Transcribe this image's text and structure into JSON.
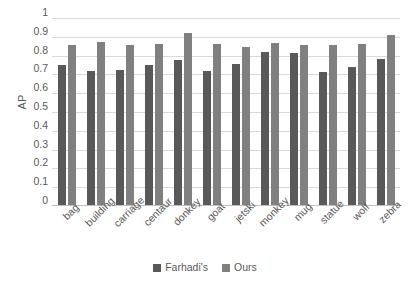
{
  "chart_data": {
    "type": "bar",
    "title": "",
    "xlabel": "",
    "ylabel": "AP",
    "ylim": [
      0,
      1
    ],
    "ytick_step": 0.1,
    "yticks": [
      "1",
      "0.9",
      "0.8",
      "0.7",
      "0.6",
      "0.5",
      "0.4",
      "0.3",
      "0.2",
      "0.1",
      "0"
    ],
    "grid": true,
    "legend_position": "bottom",
    "categories": [
      "bag",
      "building",
      "carriage",
      "centaur",
      "donkey",
      "goat",
      "jetski",
      "monkey",
      "mug",
      "statue",
      "wolf",
      "zebra"
    ],
    "series": [
      {
        "name": "Farhadi's",
        "color": "#595959",
        "values": [
          0.75,
          0.72,
          0.725,
          0.75,
          0.775,
          0.72,
          0.755,
          0.82,
          0.815,
          0.715,
          0.74,
          0.78
        ]
      },
      {
        "name": "Ours",
        "color": "#808080",
        "values": [
          0.855,
          0.87,
          0.855,
          0.86,
          0.92,
          0.86,
          0.845,
          0.865,
          0.855,
          0.855,
          0.86,
          0.91
        ]
      }
    ]
  },
  "legend": {
    "items": [
      {
        "label": "Farhadi's"
      },
      {
        "label": "Ours"
      }
    ]
  }
}
